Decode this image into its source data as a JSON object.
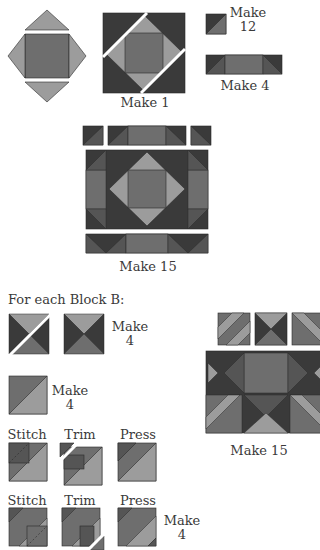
{
  "colors": {
    "dark": "#3a3a3a",
    "medium": "#6e6e6e",
    "medium_dark": "#555555",
    "light": "#9c9c9c",
    "lighter": "#a8a8a8",
    "outline": "#2a2a2a",
    "background": "#ffffff"
  },
  "section_a": {
    "unit_label": "Make 1",
    "hst_label_line1": "Make",
    "hst_label_line2": "12",
    "strip_label": "Make 4",
    "block_label": "Make 15"
  },
  "section_b": {
    "heading": "For each Block B:",
    "qst_label_line1": "Make",
    "qst_label_line2": "4",
    "hst_label_line1": "Make",
    "hst_label_line2": "4",
    "row1": {
      "stitch": "Stitch",
      "trim": "Trim",
      "press": "Press"
    },
    "row2": {
      "stitch": "Stitch",
      "trim": "Trim",
      "press": "Press",
      "make_line1": "Make",
      "make_line2": "4"
    },
    "block_label": "Make 15"
  }
}
